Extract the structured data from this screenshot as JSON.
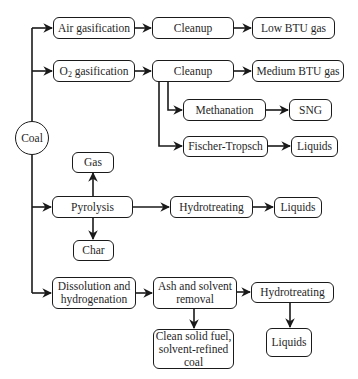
{
  "diagram": {
    "type": "flowchart",
    "root": "Coal",
    "nodes": {
      "coal": "Coal",
      "air_gasification": "Air gasification",
      "cleanup_1": "Cleanup",
      "low_btu_gas": "Low BTU gas",
      "o2_gasification_prefix": "O",
      "o2_gasification_sub": "2",
      "o2_gasification_suffix": " gasification",
      "cleanup_2": "Cleanup",
      "medium_btu_gas": "Medium BTU gas",
      "methanation": "Methanation",
      "sng": "SNG",
      "fischer_tropsch": "Fischer-Tropsch",
      "liquids_ft": "Liquids",
      "gas": "Gas",
      "pyrolysis": "Pyrolysis",
      "char": "Char",
      "hydrotreating_1": "Hydrotreating",
      "liquids_pyro": "Liquids",
      "dissolution_line1": "Dissolution and",
      "dissolution_line2": "hydrogenation",
      "ash_removal_line1": "Ash and solvent",
      "ash_removal_line2": "removal",
      "hydrotreating_2": "Hydrotreating",
      "clean_fuel_line1": "Clean solid fuel,",
      "clean_fuel_line2": "solvent-refined",
      "clean_fuel_line3": "coal",
      "liquids_dissolution": "Liquids"
    },
    "edges": [
      [
        "Coal",
        "Air gasification"
      ],
      [
        "Air gasification",
        "Cleanup"
      ],
      [
        "Cleanup",
        "Low BTU gas"
      ],
      [
        "Coal",
        "O2 gasification"
      ],
      [
        "O2 gasification",
        "Cleanup"
      ],
      [
        "Cleanup",
        "Medium BTU gas"
      ],
      [
        "Cleanup",
        "Methanation"
      ],
      [
        "Methanation",
        "SNG"
      ],
      [
        "Cleanup",
        "Fischer-Tropsch"
      ],
      [
        "Fischer-Tropsch",
        "Liquids"
      ],
      [
        "Coal",
        "Pyrolysis"
      ],
      [
        "Pyrolysis",
        "Gas"
      ],
      [
        "Pyrolysis",
        "Char"
      ],
      [
        "Pyrolysis",
        "Hydrotreating"
      ],
      [
        "Hydrotreating",
        "Liquids"
      ],
      [
        "Coal",
        "Dissolution and hydrogenation"
      ],
      [
        "Dissolution and hydrogenation",
        "Ash and solvent removal"
      ],
      [
        "Ash and solvent removal",
        "Clean solid fuel, solvent-refined coal"
      ],
      [
        "Ash and solvent removal",
        "Hydrotreating"
      ],
      [
        "Hydrotreating",
        "Liquids"
      ]
    ],
    "colors": {
      "stroke": "#1a1a1a",
      "background": "#ffffff",
      "text": "#1f1f1f"
    }
  }
}
